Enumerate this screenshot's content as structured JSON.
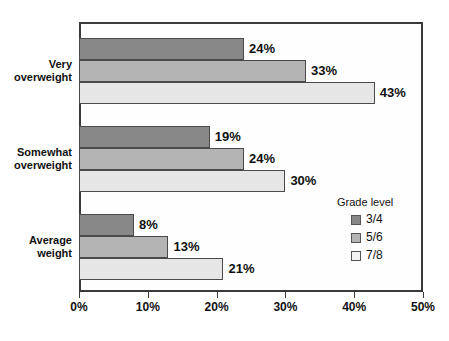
{
  "chart_data": {
    "type": "bar",
    "orientation": "horizontal",
    "title": "",
    "xlabel": "",
    "ylabel": "",
    "categories": [
      "Very overweight",
      "Somewhat overweight",
      "Average weight"
    ],
    "series": [
      {
        "name": "3/4",
        "values": [
          24,
          19,
          8
        ],
        "color": "#888888"
      },
      {
        "name": "5/6",
        "values": [
          33,
          24,
          13
        ],
        "color": "#b4b4b4"
      },
      {
        "name": "7/8",
        "values": [
          43,
          30,
          21
        ],
        "color": "#e6e6e6"
      }
    ],
    "value_labels": [
      [
        "24%",
        "19%",
        "8%"
      ],
      [
        "33%",
        "24%",
        "13%"
      ],
      [
        "43%",
        "30%",
        "21%"
      ]
    ],
    "xlim": [
      0,
      50
    ],
    "xticks": [
      0,
      10,
      20,
      30,
      40,
      50
    ],
    "xtick_labels": [
      "0%",
      "10%",
      "20%",
      "30%",
      "40%",
      "50%"
    ],
    "grid": false,
    "legend": {
      "title": "Grade level",
      "position": "inside-right-lower",
      "entries": [
        "3/4",
        "5/6",
        "7/8"
      ]
    }
  },
  "categories_display": {
    "c0": "Very\noverweight",
    "c1": "Somewhat\noverweight",
    "c2": "Average\nweight"
  },
  "colors": {
    "series_3_4": "#888888",
    "series_5_6": "#b4b4b4",
    "series_7_8": "#e6e6e6",
    "frame": "#3a3a3a",
    "text": "#111111",
    "background": "#ffffff"
  }
}
